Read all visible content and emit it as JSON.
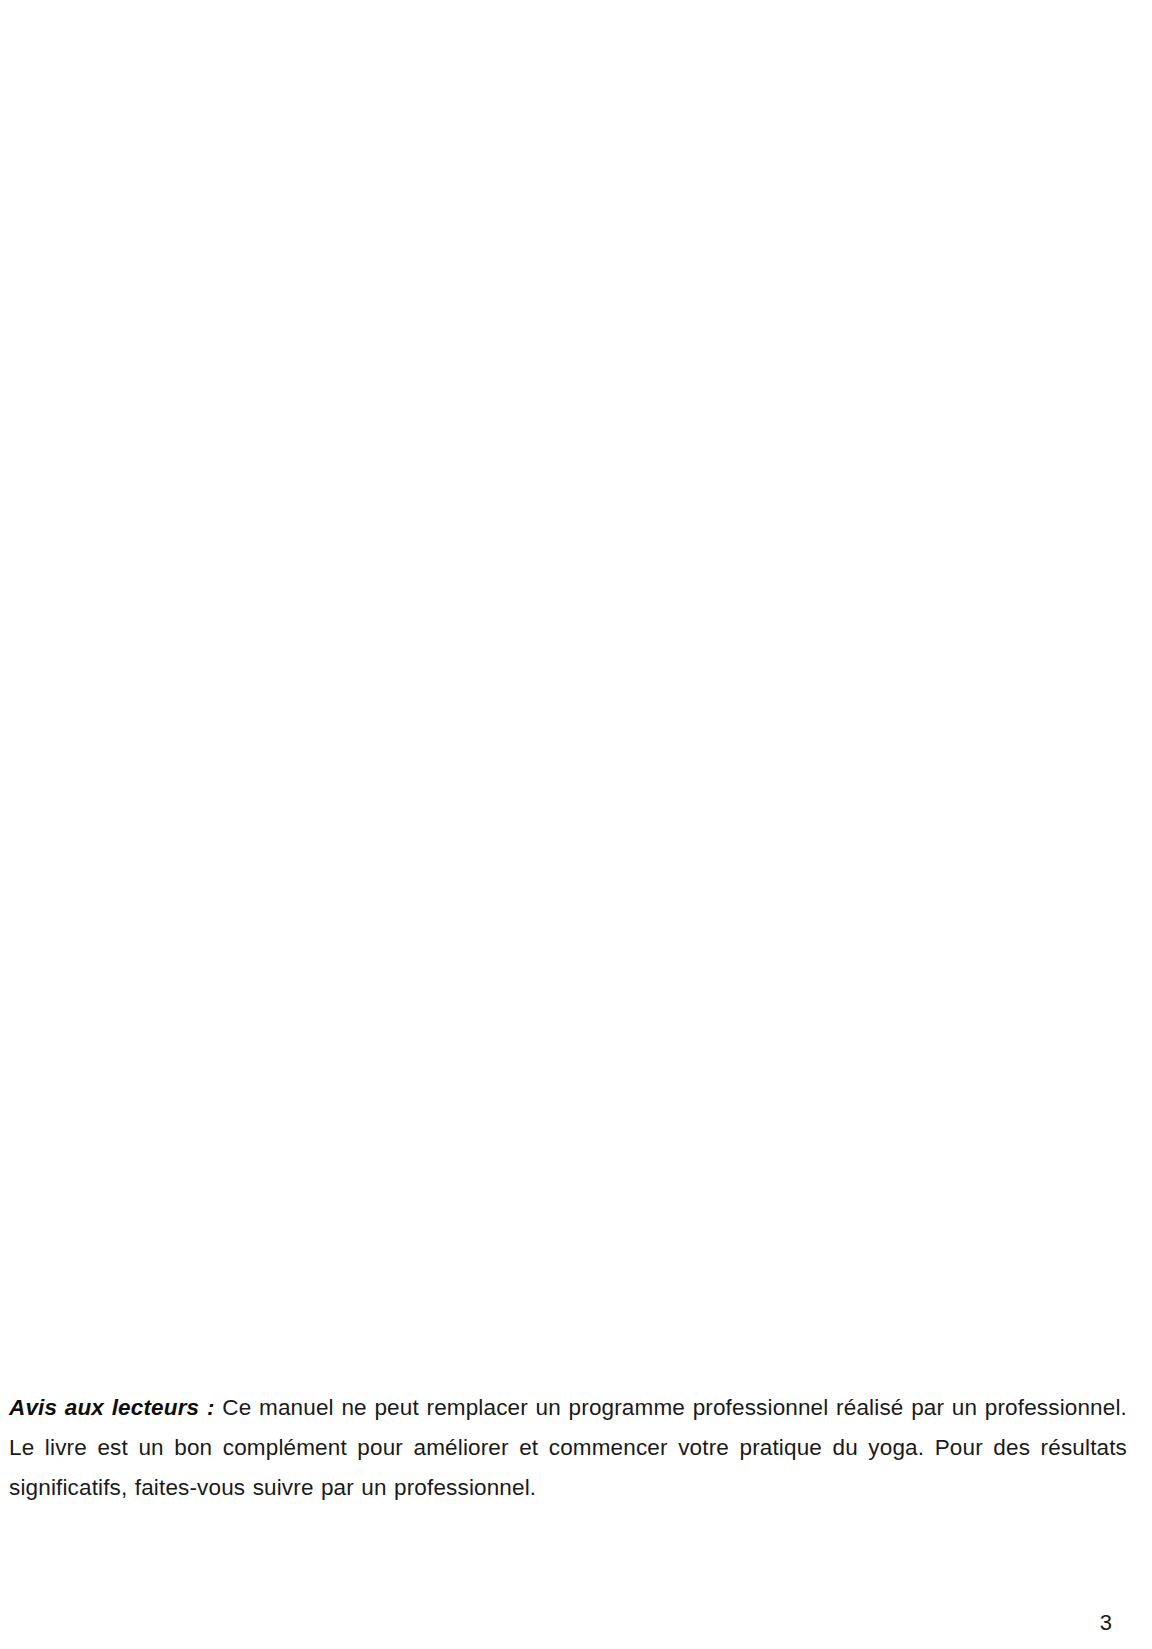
{
  "notice": {
    "label": "Avis aux lecteurs :",
    "text": "Ce manuel ne peut remplacer un programme professionnel réalisé par un professionnel. Le livre est un bon complément pour améliorer et commencer votre pratique du yoga. Pour des résultats significatifs, faites-vous suivre par un professionnel."
  },
  "page_number": "3"
}
